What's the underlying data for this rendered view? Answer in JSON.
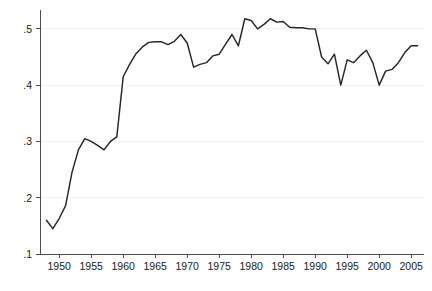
{
  "chart_data": {
    "type": "line",
    "title": "",
    "subtitle": "",
    "xlabel": "",
    "ylabel": "",
    "xlim": [
      1947,
      2007
    ],
    "ylim": [
      0.1,
      0.53
    ],
    "grid": true,
    "legend": false,
    "legend_position": "none",
    "line_color": "#262626",
    "background_color": "#ffffff",
    "gridline_color": "#f2f2f2",
    "axis_color": "#4d4d4d",
    "y_ticks": [
      0.1,
      0.2,
      0.3,
      0.4,
      0.5
    ],
    "y_tick_labels": [
      ".1",
      ".2",
      ".3",
      ".4",
      ".5"
    ],
    "x_ticks": [
      1950,
      1955,
      1960,
      1965,
      1970,
      1975,
      1980,
      1985,
      1990,
      1995,
      2000,
      2005
    ],
    "x_tick_labels": [
      "1950",
      "1955",
      "1960",
      "1965",
      "1970",
      "1975",
      "1980",
      "1985",
      "1990",
      "1995",
      "2000",
      "2005"
    ],
    "x": [
      1948,
      1949,
      1950,
      1951,
      1952,
      1953,
      1954,
      1955,
      1956,
      1957,
      1958,
      1959,
      1960,
      1961,
      1962,
      1963,
      1964,
      1965,
      1966,
      1967,
      1968,
      1969,
      1970,
      1971,
      1972,
      1973,
      1974,
      1975,
      1976,
      1977,
      1978,
      1979,
      1980,
      1981,
      1982,
      1983,
      1984,
      1985,
      1986,
      1987,
      1988,
      1989,
      1990,
      1991,
      1992,
      1993,
      1994,
      1995,
      1996,
      1997,
      1998,
      1999,
      2000,
      2001,
      2002,
      2003,
      2004,
      2005,
      2006
    ],
    "values": [
      0.16,
      0.145,
      0.163,
      0.186,
      0.245,
      0.285,
      0.305,
      0.3,
      0.293,
      0.285,
      0.3,
      0.308,
      0.415,
      0.437,
      0.456,
      0.468,
      0.476,
      0.477,
      0.477,
      0.472,
      0.478,
      0.49,
      0.475,
      0.432,
      0.437,
      0.44,
      0.452,
      0.455,
      0.473,
      0.49,
      0.47,
      0.518,
      0.515,
      0.5,
      0.508,
      0.518,
      0.512,
      0.513,
      0.503,
      0.502,
      0.502,
      0.5,
      0.5,
      0.45,
      0.438,
      0.455,
      0.4,
      0.445,
      0.44,
      0.452,
      0.462,
      0.44,
      0.4,
      0.425,
      0.428,
      0.44,
      0.458,
      0.47,
      0.47
    ],
    "series": [
      {
        "name": "series-1",
        "values": [
          0.16,
          0.145,
          0.163,
          0.186,
          0.245,
          0.285,
          0.305,
          0.3,
          0.293,
          0.285,
          0.3,
          0.308,
          0.415,
          0.437,
          0.456,
          0.468,
          0.476,
          0.477,
          0.477,
          0.472,
          0.478,
          0.49,
          0.475,
          0.432,
          0.437,
          0.44,
          0.452,
          0.455,
          0.473,
          0.49,
          0.47,
          0.518,
          0.515,
          0.5,
          0.508,
          0.518,
          0.512,
          0.513,
          0.503,
          0.502,
          0.502,
          0.5,
          0.5,
          0.45,
          0.438,
          0.455,
          0.4,
          0.445,
          0.44,
          0.452,
          0.462,
          0.44,
          0.4,
          0.425,
          0.428,
          0.44,
          0.458,
          0.47,
          0.47
        ]
      }
    ]
  },
  "plot_geometry": {
    "left": 40,
    "right": 424,
    "top": 12,
    "bottom": 254
  }
}
